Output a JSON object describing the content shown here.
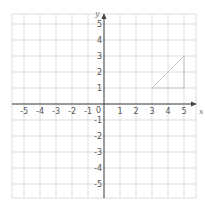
{
  "diagram": {
    "type": "coordinate-grid",
    "x_axis": {
      "label": "x",
      "min": -6,
      "max": 5,
      "tick_labels": [
        "-5",
        "-4",
        "-3",
        "-2",
        "-1",
        "1",
        "2",
        "3",
        "4",
        "5"
      ]
    },
    "y_axis": {
      "label": "y",
      "min": -6,
      "max": 5,
      "tick_labels": [
        "5",
        "4",
        "3",
        "2",
        "1",
        "-1",
        "-2",
        "-3",
        "-4",
        "-5"
      ]
    },
    "origin_label": "0",
    "shape": {
      "type": "triangle",
      "vertices": [
        [
          3,
          1
        ],
        [
          5,
          3
        ],
        [
          5,
          1
        ]
      ]
    },
    "colors": {
      "grid": "#d4d4d4",
      "axis": "#444444",
      "shape": "#c8c8c8",
      "labels": "#555555"
    }
  }
}
